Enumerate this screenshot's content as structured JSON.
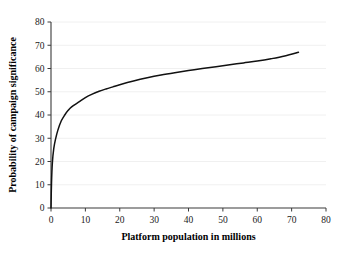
{
  "chart_data": {
    "type": "line",
    "title": "",
    "xlabel": "Platform population in millions",
    "ylabel": "Probability of campaign significance",
    "xlim": [
      0,
      80
    ],
    "ylim": [
      0,
      80
    ],
    "xticks": [
      0,
      10,
      20,
      30,
      40,
      50,
      60,
      70,
      80
    ],
    "yticks": [
      0,
      10,
      20,
      30,
      40,
      50,
      60,
      70,
      80
    ],
    "xtick_labels": [
      "0",
      "10",
      "20",
      "30",
      "40",
      "50",
      "60",
      "70",
      "80"
    ],
    "ytick_labels": [
      "0",
      "10",
      "20",
      "30",
      "40",
      "50",
      "60",
      "70",
      "80"
    ],
    "grid": "horizontal",
    "legend": "none",
    "series": [
      {
        "name": "Probability of campaign significance",
        "color": "#111111",
        "x": [
          0,
          0.15,
          0.4,
          0.8,
          1.3,
          2,
          3,
          4,
          5,
          6,
          8,
          10,
          12,
          14,
          16,
          18,
          20,
          24,
          28,
          32,
          36,
          40,
          44,
          48,
          52,
          56,
          60,
          64,
          68,
          72
        ],
        "y": [
          0,
          11,
          19.5,
          25.5,
          29.5,
          33.5,
          37.5,
          40,
          42,
          43.5,
          45.5,
          47.5,
          49,
          50.2,
          51.2,
          52.1,
          53,
          54.6,
          56,
          57.2,
          58.2,
          59.1,
          60,
          60.8,
          61.6,
          62.4,
          63.2,
          64.2,
          65.4,
          67
        ]
      }
    ]
  },
  "axes": {
    "x_axis_name": "x-axis",
    "y_axis_name": "y-axis"
  }
}
